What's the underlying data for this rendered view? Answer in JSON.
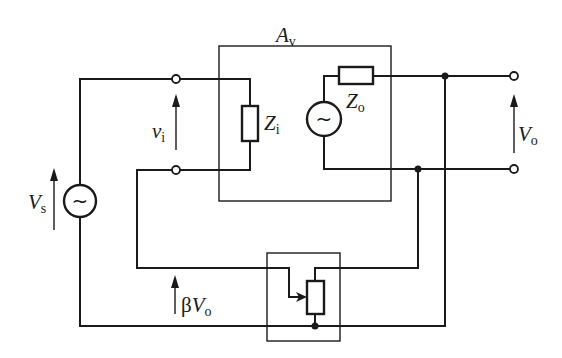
{
  "diagram": {
    "type": "circuit-schematic",
    "labels": {
      "amplifier": {
        "main": "A",
        "sub": "v"
      },
      "input_impedance": {
        "main": "Z",
        "sub": "i"
      },
      "output_impedance": {
        "main": "Z",
        "sub": "o"
      },
      "input_voltage": {
        "main": "v",
        "sub": "i"
      },
      "output_voltage": {
        "main": "V",
        "sub": "o"
      },
      "source_voltage": {
        "main": "V",
        "sub": "s"
      },
      "feedback_voltage": {
        "prefix": "β",
        "main": "V",
        "sub": "o"
      }
    },
    "source_symbol": "~",
    "components": [
      {
        "id": "amplifier-block",
        "label": "Av"
      },
      {
        "id": "input-impedance",
        "label": "Zi"
      },
      {
        "id": "output-impedance",
        "label": "Zo"
      },
      {
        "id": "internal-source",
        "label": "~"
      },
      {
        "id": "signal-source",
        "label": "Vs"
      },
      {
        "id": "feedback-network",
        "label": "potentiometer divider"
      }
    ]
  }
}
